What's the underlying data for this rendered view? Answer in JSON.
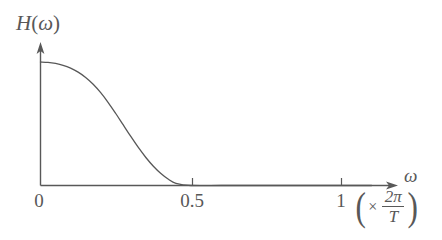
{
  "figure": {
    "name": "frequency-response-plot",
    "background_color": "#ffffff",
    "ink_color": "#585858",
    "y_axis_label": "H(ω)",
    "y_axis_label_parts": {
      "function_name": "H",
      "open_paren": "(",
      "variable": "ω",
      "close_paren": ")"
    },
    "x_axis_symbol": "ω",
    "x_axis_units": {
      "open_paren": "(",
      "times": "×",
      "numerator": "2π",
      "denominator": "T",
      "close_paren": ")",
      "text": "(× 2π/T)"
    },
    "tick_labels": {
      "zero": "0",
      "half": "0.5",
      "one": "1"
    }
  },
  "chart_data": {
    "type": "line",
    "title": "",
    "subtitle": "",
    "xlabel": "ω  (× 2π/T)",
    "ylabel": "H(ω)",
    "xlim": [
      0,
      1.15
    ],
    "ylim": [
      0,
      1.12
    ],
    "grid": false,
    "legend": null,
    "legend_position": "none",
    "x_ticks": [
      0,
      0.5,
      1
    ],
    "x_tick_labels": [
      "0",
      "0.5",
      "1"
    ],
    "y_ticks": [],
    "y_tick_labels": [],
    "axis_arrows": {
      "x": true,
      "y": true
    },
    "annotations": [],
    "series": [
      {
        "name": "H(ω)",
        "color": "#585858",
        "line_width": 1.3,
        "description": "Raised-cosine style low-pass magnitude response: flat near ω=0, monotonically decaying, reaching zero at ω ≈ 0.45 and remaining zero thereafter",
        "x": [
          0.0,
          0.025,
          0.05,
          0.075,
          0.1,
          0.125,
          0.15,
          0.175,
          0.2,
          0.225,
          0.25,
          0.275,
          0.3,
          0.325,
          0.35,
          0.375,
          0.4,
          0.425,
          0.45,
          0.5,
          0.6,
          0.7,
          0.8,
          0.9,
          1.0,
          1.1
        ],
        "y": [
          1.0,
          0.997,
          0.988,
          0.973,
          0.95,
          0.918,
          0.875,
          0.82,
          0.752,
          0.672,
          0.583,
          0.49,
          0.397,
          0.308,
          0.227,
          0.156,
          0.097,
          0.05,
          0.018,
          0.0,
          0.0,
          0.0,
          0.0,
          0.0,
          0.0,
          0.0
        ]
      }
    ]
  }
}
